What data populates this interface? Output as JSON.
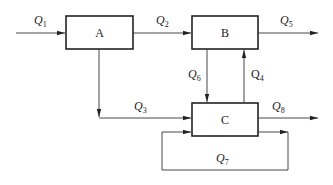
{
  "diagram": {
    "type": "flow-block-diagram",
    "nodes": [
      {
        "id": "A",
        "label": "A"
      },
      {
        "id": "B",
        "label": "B"
      },
      {
        "id": "C",
        "label": "C"
      }
    ],
    "flows": [
      {
        "id": "Q1",
        "symbol": "Q",
        "sub": "1",
        "from": "input",
        "to": "A"
      },
      {
        "id": "Q2",
        "symbol": "Q",
        "sub": "2",
        "from": "A",
        "to": "B"
      },
      {
        "id": "Q3",
        "symbol": "Q",
        "sub": "3",
        "from": "A",
        "to": "C"
      },
      {
        "id": "Q4",
        "symbol": "Q",
        "sub": "4",
        "from": "C",
        "to": "B"
      },
      {
        "id": "Q5",
        "symbol": "Q",
        "sub": "5",
        "from": "B",
        "to": "output"
      },
      {
        "id": "Q6",
        "symbol": "Q",
        "sub": "6",
        "from": "B",
        "to": "C"
      },
      {
        "id": "Q7",
        "symbol": "Q",
        "sub": "7",
        "from": "C",
        "to": "C"
      },
      {
        "id": "Q8",
        "symbol": "Q",
        "sub": "8",
        "from": "C",
        "to": "output"
      }
    ]
  }
}
